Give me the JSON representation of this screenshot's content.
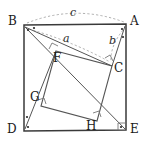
{
  "figure": {
    "type": "geometry-diagram",
    "canvas": {
      "width": 148,
      "height": 148
    },
    "colors": {
      "outer_square_stroke": "#3a3a3a",
      "inner_square_stroke": "#4a4a4a",
      "line_stroke": "#555555",
      "dashed_arc_stroke": "#8a8a8a",
      "right_angle_stroke": "#777777",
      "label_text": "#1a1a1a",
      "background": "#ffffff"
    },
    "outer_square": {
      "name": "BADE",
      "vertices": [
        {
          "label": "B",
          "x": 24,
          "y": 25,
          "label_x": 10,
          "label_y": 16
        },
        {
          "label": "A",
          "x": 126,
          "y": 24,
          "label_x": 130,
          "label_y": 16
        },
        {
          "label": "E",
          "x": 126,
          "y": 130,
          "label_x": 130,
          "label_y": 124
        },
        {
          "label": "D",
          "x": 24,
          "y": 131,
          "label_x": 9,
          "label_y": 124
        }
      ]
    },
    "inner_square": {
      "name": "FCHG",
      "vertices": [
        {
          "label": "F",
          "x": 56,
          "y": 51,
          "label_x": 55,
          "label_y": 53
        },
        {
          "label": "C",
          "x": 112,
          "y": 66,
          "label_x": 115,
          "label_y": 64
        },
        {
          "label": "H",
          "x": 97,
          "y": 121,
          "label_x": 87,
          "label_y": 122
        },
        {
          "label": "G",
          "x": 41,
          "y": 106,
          "label_x": 30,
          "label_y": 94
        }
      ]
    },
    "segments": [
      {
        "name": "B-C",
        "from": "B",
        "to": "C"
      },
      {
        "name": "B-E",
        "from": "B",
        "to": "E"
      },
      {
        "name": "A-C",
        "from": "A",
        "to": "C"
      },
      {
        "name": "D-F",
        "from": "D",
        "to": "F"
      }
    ],
    "arcs": [
      {
        "name": "arc-c",
        "label": "c",
        "from": "B",
        "to": "A",
        "label_x": 70,
        "label_y": 10
      },
      {
        "name": "arc-a",
        "label": "a",
        "from": "B",
        "to": "C",
        "label_x": 64,
        "label_y": 37
      },
      {
        "name": "arc-b",
        "label": "b",
        "from": "A",
        "to": "C",
        "label_x": 110,
        "label_y": 38
      }
    ],
    "right_angle_marks": [
      {
        "at": "F",
        "name": "right-angle-f"
      },
      {
        "at": "C",
        "name": "right-angle-c"
      },
      {
        "at": "H",
        "name": "right-angle-h"
      },
      {
        "at": "G",
        "name": "right-angle-g"
      },
      {
        "at": "E",
        "name": "right-angle-e"
      }
    ],
    "angle_dots": [
      {
        "near": "B",
        "name": "angle-dot-b1"
      },
      {
        "near": "B",
        "name": "angle-dot-b2"
      },
      {
        "near": "A",
        "name": "angle-dot-a1"
      },
      {
        "near": "A",
        "name": "angle-dot-a2"
      },
      {
        "near": "D",
        "name": "angle-dot-d1"
      },
      {
        "near": "D",
        "name": "angle-dot-d2"
      },
      {
        "near": "E",
        "name": "angle-dot-e1"
      }
    ]
  }
}
